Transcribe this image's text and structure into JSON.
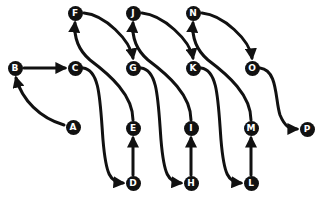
{
  "diagram": {
    "type": "sequence-path",
    "stroke_color": "#111111",
    "node_color": "#111111",
    "label_color": "#ffffff",
    "nodes": [
      {
        "id": "A",
        "label": "A",
        "x": 73,
        "y": 127
      },
      {
        "id": "B",
        "label": "B",
        "x": 15,
        "y": 68
      },
      {
        "id": "C",
        "label": "C",
        "x": 75,
        "y": 68
      },
      {
        "id": "D",
        "label": "D",
        "x": 133,
        "y": 183
      },
      {
        "id": "E",
        "label": "E",
        "x": 133,
        "y": 128
      },
      {
        "id": "F",
        "label": "F",
        "x": 75,
        "y": 13
      },
      {
        "id": "G",
        "label": "G",
        "x": 133,
        "y": 68
      },
      {
        "id": "H",
        "label": "H",
        "x": 191,
        "y": 183
      },
      {
        "id": "I",
        "label": "I",
        "x": 191,
        "y": 128
      },
      {
        "id": "J",
        "label": "J",
        "x": 133,
        "y": 13
      },
      {
        "id": "K",
        "label": "K",
        "x": 193,
        "y": 68
      },
      {
        "id": "L",
        "label": "L",
        "x": 251,
        "y": 183
      },
      {
        "id": "M",
        "label": "M",
        "x": 251,
        "y": 128
      },
      {
        "id": "N",
        "label": "N",
        "x": 193,
        "y": 13
      },
      {
        "id": "O",
        "label": "O",
        "x": 252,
        "y": 68
      },
      {
        "id": "P",
        "label": "P",
        "x": 307,
        "y": 129
      }
    ],
    "edges": [
      {
        "from": "A",
        "to": "B"
      },
      {
        "from": "B",
        "to": "C"
      },
      {
        "from": "C",
        "to": "D"
      },
      {
        "from": "D",
        "to": "E"
      },
      {
        "from": "E",
        "to": "F"
      },
      {
        "from": "F",
        "to": "G"
      },
      {
        "from": "G",
        "to": "H"
      },
      {
        "from": "H",
        "to": "I"
      },
      {
        "from": "I",
        "to": "J"
      },
      {
        "from": "J",
        "to": "K"
      },
      {
        "from": "K",
        "to": "L"
      },
      {
        "from": "L",
        "to": "M"
      },
      {
        "from": "M",
        "to": "N"
      },
      {
        "from": "N",
        "to": "O"
      },
      {
        "from": "O",
        "to": "P"
      }
    ]
  }
}
